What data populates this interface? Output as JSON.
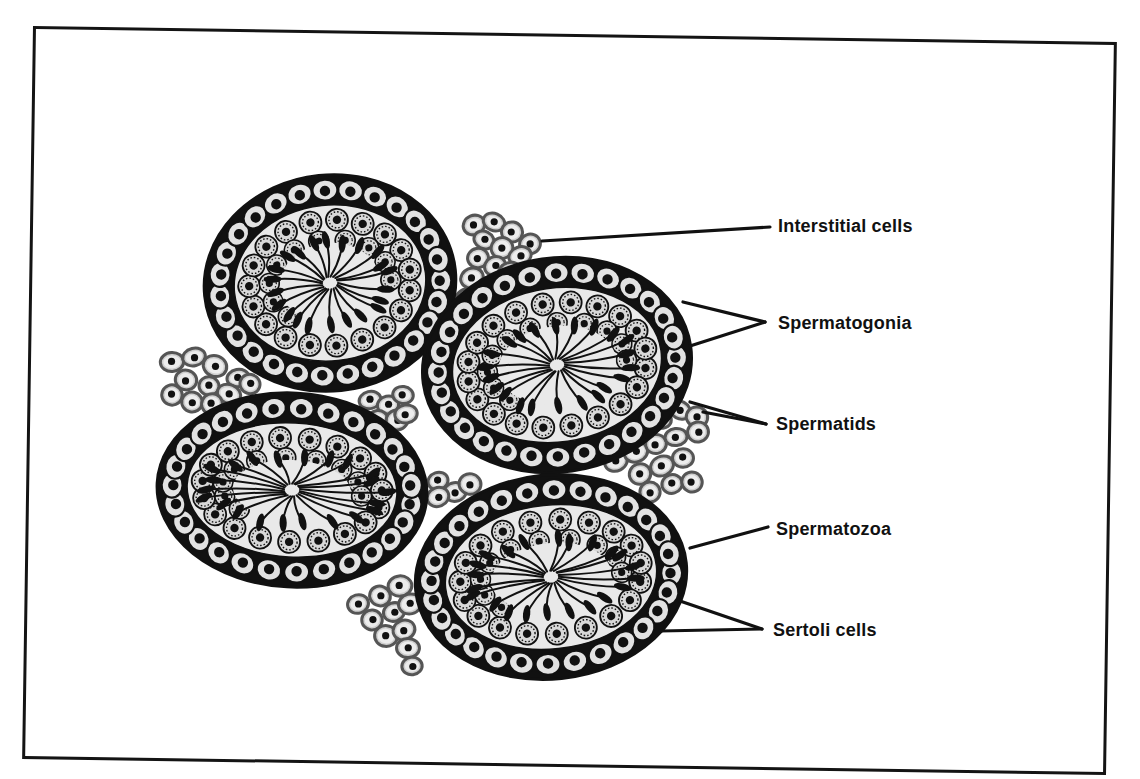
{
  "figure": {
    "type": "histology-diagram",
    "tubule_count": 4,
    "interstitial_cluster_count": 6
  },
  "labels": [
    {
      "id": "interstitial",
      "text": "Interstitial cells",
      "x": 778,
      "y": 216,
      "pointers": [
        [
          542,
          241,
          770,
          227
        ]
      ]
    },
    {
      "id": "spermatogonia",
      "text": "Spermatogonia",
      "x": 778,
      "y": 313,
      "pointers": [
        [
          683,
          302,
          765,
          322
        ],
        [
          690,
          346,
          765,
          322
        ]
      ]
    },
    {
      "id": "spermatids",
      "text": "Spermatids",
      "x": 776,
      "y": 414,
      "pointers": [
        [
          690,
          402,
          766,
          424
        ],
        [
          703,
          412,
          766,
          424
        ]
      ]
    },
    {
      "id": "spermatozoa",
      "text": "Spermatozoa",
      "x": 776,
      "y": 519,
      "pointers": [
        [
          690,
          548,
          768,
          527
        ]
      ]
    },
    {
      "id": "sertoli",
      "text": "Sertoli cells",
      "x": 773,
      "y": 620,
      "pointers": [
        [
          680,
          601,
          762,
          629
        ],
        [
          660,
          631,
          762,
          629
        ]
      ]
    }
  ],
  "tubules": [
    {
      "id": "tubule-top-left",
      "cx": 330,
      "cy": 283,
      "rx": 126,
      "ry": 108,
      "rot": -6
    },
    {
      "id": "tubule-right",
      "cx": 557,
      "cy": 365,
      "rx": 135,
      "ry": 107,
      "rot": -8
    },
    {
      "id": "tubule-bottom-left",
      "cx": 292,
      "cy": 490,
      "rx": 135,
      "ry": 97,
      "rot": 3
    },
    {
      "id": "tubule-bottom-right",
      "cx": 551,
      "cy": 577,
      "rx": 136,
      "ry": 102,
      "rot": -6
    }
  ],
  "interstitial_clusters": [
    {
      "id": "cluster-top",
      "cells": [
        [
          474,
          225
        ],
        [
          494,
          222
        ],
        [
          512,
          232
        ],
        [
          530,
          244
        ],
        [
          484,
          240
        ],
        [
          502,
          248
        ],
        [
          520,
          256
        ],
        [
          478,
          258
        ],
        [
          495,
          266
        ],
        [
          510,
          272
        ],
        [
          472,
          278
        ],
        [
          488,
          286
        ],
        [
          468,
          298
        ]
      ]
    },
    {
      "id": "cluster-left",
      "cells": [
        [
          172,
          362
        ],
        [
          194,
          357
        ],
        [
          215,
          366
        ],
        [
          238,
          378
        ],
        [
          186,
          380
        ],
        [
          209,
          386
        ],
        [
          229,
          394
        ],
        [
          172,
          395
        ],
        [
          192,
          402
        ],
        [
          212,
          404
        ],
        [
          250,
          384
        ]
      ]
    },
    {
      "id": "cluster-mid",
      "cells": [
        [
          370,
          400
        ],
        [
          388,
          405
        ],
        [
          403,
          395
        ],
        [
          378,
          420
        ],
        [
          397,
          420
        ],
        [
          406,
          414
        ]
      ]
    },
    {
      "id": "cluster-mid-low",
      "cells": [
        [
          438,
          481
        ],
        [
          455,
          492
        ],
        [
          438,
          497
        ],
        [
          470,
          484
        ]
      ]
    },
    {
      "id": "cluster-right",
      "cells": [
        [
          640,
          425
        ],
        [
          660,
          418
        ],
        [
          680,
          410
        ],
        [
          697,
          417
        ],
        [
          616,
          461
        ],
        [
          636,
          452
        ],
        [
          656,
          444
        ],
        [
          676,
          437
        ],
        [
          698,
          432
        ],
        [
          640,
          474
        ],
        [
          662,
          466
        ],
        [
          683,
          458
        ],
        [
          650,
          492
        ],
        [
          672,
          484
        ],
        [
          692,
          482
        ]
      ]
    },
    {
      "id": "cluster-bottom",
      "cells": [
        [
          358,
          604
        ],
        [
          380,
          596
        ],
        [
          400,
          586
        ],
        [
          372,
          620
        ],
        [
          394,
          612
        ],
        [
          410,
          604
        ],
        [
          386,
          636
        ],
        [
          404,
          630
        ],
        [
          408,
          648
        ],
        [
          412,
          666
        ]
      ]
    }
  ],
  "colors": {
    "ink": "#111111",
    "cell_fill": "#e2e2e2",
    "interstitial_fill": "#cfcfcf",
    "interstitial_edge": "#555555",
    "lumen": "#e9e9e9",
    "frame": "#141414",
    "background": "#ffffff"
  }
}
